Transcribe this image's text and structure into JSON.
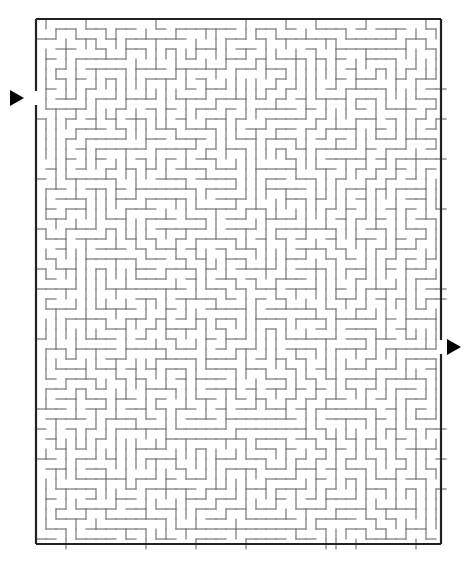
{
  "maze": {
    "border": {
      "x": 36,
      "y": 19,
      "w": 405,
      "h": 525,
      "color": "#222222"
    },
    "cell": 10,
    "wall_color": "#777777",
    "entrance": {
      "side": "left",
      "y": 98,
      "gap": 14
    },
    "exit": {
      "side": "right",
      "y": 347,
      "gap": 14
    },
    "arrows": [
      {
        "name": "start-arrow",
        "x": 10,
        "y": 98,
        "dir": "right"
      },
      {
        "name": "finish-arrow",
        "x": 447,
        "y": 347,
        "dir": "right"
      }
    ],
    "seed": 7
  }
}
